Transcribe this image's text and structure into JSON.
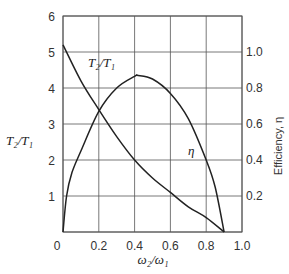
{
  "chart_data": {
    "type": "line",
    "title": "",
    "xlabel": "ω2/ω1",
    "ylabel": "T2/T1",
    "y2label": "Efficiency, η",
    "xlim": [
      0,
      1.0
    ],
    "ylim": [
      0,
      6
    ],
    "y2lim": [
      0,
      1.2
    ],
    "grid": true,
    "x_ticks": [
      "0",
      "0.2",
      "0.4",
      "0.6",
      "0.8",
      "1.0"
    ],
    "y_ticks": [
      "0",
      "1",
      "2",
      "3",
      "4",
      "5",
      "6"
    ],
    "y2_ticks": [
      "0.2",
      "0.4",
      "0.6",
      "0.8",
      "1.0"
    ],
    "series": [
      {
        "name": "T2/T1",
        "axis": "left",
        "x": [
          0,
          0.1,
          0.2,
          0.3,
          0.4,
          0.5,
          0.6,
          0.7,
          0.8,
          0.9
        ],
        "values": [
          5.2,
          4.2,
          3.4,
          2.65,
          2.0,
          1.5,
          1.1,
          0.7,
          0.4,
          0.0
        ]
      },
      {
        "name": "η",
        "axis": "right",
        "x": [
          0,
          0.02,
          0.05,
          0.1,
          0.2,
          0.3,
          0.4,
          0.42,
          0.5,
          0.6,
          0.7,
          0.8,
          0.85,
          0.9
        ],
        "values": [
          0,
          0.2,
          0.33,
          0.45,
          0.67,
          0.8,
          0.865,
          0.87,
          0.85,
          0.77,
          0.63,
          0.4,
          0.25,
          0.0
        ]
      }
    ],
    "annotations": [
      {
        "text": "T2/T1",
        "x": 0.27,
        "y": 4.2
      },
      {
        "text": "η",
        "x": 0.72,
        "y": 2.4
      }
    ]
  },
  "labels": {
    "left_axis_label": "T₂/T₁",
    "right_axis_label": "Efficiency, η",
    "x_axis_label": "ω₂/ω₁",
    "curve_label_torque": "T₂/T₁",
    "curve_label_eff": "η"
  },
  "colors": {
    "line": "#222222",
    "grid": "#555555"
  }
}
